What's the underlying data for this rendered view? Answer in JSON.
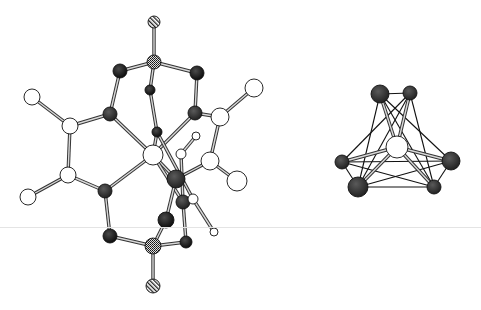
{
  "figure": {
    "caption": "",
    "background": "#ffffff",
    "scanline_color": "#e4e4e4"
  },
  "styles": {
    "black": {
      "fill": "#1a1a1a",
      "stroke": "#000000"
    },
    "darkgray": {
      "fill": "#3a3a3a",
      "stroke": "#000000"
    },
    "white": {
      "fill": "#ffffff",
      "stroke": "#222222"
    },
    "grid": {
      "fill": "url(#gridPat)",
      "stroke": "#000000"
    },
    "hatched": {
      "fill": "url(#hatchPat)",
      "stroke": "#000000"
    }
  },
  "molecules": [
    {
      "id": "left-complex",
      "label": "Molecule",
      "atoms": [
        {
          "id": "a1",
          "x": 154,
          "y": 22,
          "r": 6,
          "style": "hatched"
        },
        {
          "id": "a2",
          "x": 154,
          "y": 62,
          "r": 7,
          "style": "grid"
        },
        {
          "id": "a3",
          "x": 120,
          "y": 71,
          "r": 7,
          "style": "black"
        },
        {
          "id": "a4",
          "x": 197,
          "y": 73,
          "r": 7,
          "style": "black"
        },
        {
          "id": "a5",
          "x": 150,
          "y": 90,
          "r": 5,
          "style": "black"
        },
        {
          "id": "a6",
          "x": 110,
          "y": 114,
          "r": 7,
          "style": "darkgray"
        },
        {
          "id": "a7",
          "x": 195,
          "y": 113,
          "r": 7,
          "style": "darkgray"
        },
        {
          "id": "a8",
          "x": 32,
          "y": 97,
          "r": 8,
          "style": "white"
        },
        {
          "id": "a9",
          "x": 70,
          "y": 126,
          "r": 8,
          "style": "white"
        },
        {
          "id": "a10",
          "x": 68,
          "y": 175,
          "r": 8,
          "style": "white"
        },
        {
          "id": "a11",
          "x": 28,
          "y": 197,
          "r": 8,
          "style": "white"
        },
        {
          "id": "a12",
          "x": 105,
          "y": 191,
          "r": 7,
          "style": "darkgray"
        },
        {
          "id": "a13",
          "x": 153,
          "y": 155,
          "r": 10,
          "style": "white"
        },
        {
          "id": "a14",
          "x": 157,
          "y": 132,
          "r": 5,
          "style": "black"
        },
        {
          "id": "a15",
          "x": 196,
          "y": 136,
          "r": 4,
          "style": "white"
        },
        {
          "id": "a16",
          "x": 181,
          "y": 154,
          "r": 5,
          "style": "white"
        },
        {
          "id": "a17",
          "x": 220,
          "y": 117,
          "r": 9,
          "style": "white"
        },
        {
          "id": "a18",
          "x": 254,
          "y": 88,
          "r": 9,
          "style": "white"
        },
        {
          "id": "a19",
          "x": 210,
          "y": 161,
          "r": 9,
          "style": "white"
        },
        {
          "id": "a20",
          "x": 237,
          "y": 181,
          "r": 10,
          "style": "white"
        },
        {
          "id": "a21",
          "x": 176,
          "y": 179,
          "r": 9,
          "style": "darkgray"
        },
        {
          "id": "a22",
          "x": 183,
          "y": 202,
          "r": 7,
          "style": "darkgray"
        },
        {
          "id": "a23",
          "x": 193,
          "y": 199,
          "r": 5,
          "style": "white"
        },
        {
          "id": "a24",
          "x": 166,
          "y": 220,
          "r": 8,
          "style": "black"
        },
        {
          "id": "a25",
          "x": 110,
          "y": 236,
          "r": 7,
          "style": "black"
        },
        {
          "id": "a26",
          "x": 186,
          "y": 242,
          "r": 6,
          "style": "black"
        },
        {
          "id": "a27",
          "x": 153,
          "y": 246,
          "r": 8,
          "style": "grid"
        },
        {
          "id": "a28",
          "x": 153,
          "y": 286,
          "r": 7,
          "style": "hatched"
        },
        {
          "id": "a29",
          "x": 214,
          "y": 232,
          "r": 4,
          "style": "white"
        }
      ],
      "bonds": [
        [
          "a1",
          "a2"
        ],
        [
          "a2",
          "a3"
        ],
        [
          "a2",
          "a4"
        ],
        [
          "a2",
          "a5"
        ],
        [
          "a3",
          "a6"
        ],
        [
          "a4",
          "a7"
        ],
        [
          "a5",
          "a14"
        ],
        [
          "a6",
          "a9"
        ],
        [
          "a9",
          "a8"
        ],
        [
          "a9",
          "a10"
        ],
        [
          "a10",
          "a11"
        ],
        [
          "a10",
          "a12"
        ],
        [
          "a6",
          "a13"
        ],
        [
          "a12",
          "a13"
        ],
        [
          "a7",
          "a13"
        ],
        [
          "a14",
          "a13"
        ],
        [
          "a7",
          "a17"
        ],
        [
          "a17",
          "a18"
        ],
        [
          "a17",
          "a19"
        ],
        [
          "a19",
          "a20"
        ],
        [
          "a19",
          "a21"
        ],
        [
          "a14",
          "a23"
        ],
        [
          "a15",
          "a16"
        ],
        [
          "a16",
          "a22"
        ],
        [
          "a13",
          "a21"
        ],
        [
          "a13",
          "a22"
        ],
        [
          "a21",
          "a24"
        ],
        [
          "a22",
          "a26"
        ],
        [
          "a23",
          "a29"
        ],
        [
          "a12",
          "a25"
        ],
        [
          "a25",
          "a27"
        ],
        [
          "a26",
          "a27"
        ],
        [
          "a24",
          "a27"
        ],
        [
          "a27",
          "a28"
        ]
      ]
    },
    {
      "id": "right-cluster",
      "label": "Cluster",
      "atoms": [
        {
          "id": "b1",
          "x": 380,
          "y": 94,
          "r": 9,
          "style": "darkgray"
        },
        {
          "id": "b2",
          "x": 410,
          "y": 93,
          "r": 7,
          "style": "darkgray"
        },
        {
          "id": "b3",
          "x": 397,
          "y": 147,
          "r": 11,
          "style": "white"
        },
        {
          "id": "b4",
          "x": 342,
          "y": 162,
          "r": 7,
          "style": "darkgray"
        },
        {
          "id": "b5",
          "x": 451,
          "y": 161,
          "r": 9,
          "style": "darkgray"
        },
        {
          "id": "b6",
          "x": 358,
          "y": 187,
          "r": 10,
          "style": "darkgray"
        },
        {
          "id": "b7",
          "x": 434,
          "y": 187,
          "r": 7,
          "style": "darkgray"
        }
      ],
      "bonds": [
        [
          "b3",
          "b1"
        ],
        [
          "b3",
          "b2"
        ],
        [
          "b3",
          "b4"
        ],
        [
          "b3",
          "b5"
        ],
        [
          "b3",
          "b6"
        ],
        [
          "b3",
          "b7"
        ]
      ],
      "lines": [
        [
          "b1",
          "b2"
        ],
        [
          "b1",
          "b5"
        ],
        [
          "b1",
          "b6"
        ],
        [
          "b2",
          "b4"
        ],
        [
          "b2",
          "b7"
        ],
        [
          "b4",
          "b6"
        ],
        [
          "b4",
          "b5"
        ],
        [
          "b4",
          "b7"
        ],
        [
          "b6",
          "b5"
        ],
        [
          "b6",
          "b7"
        ],
        [
          "b5",
          "b7"
        ],
        [
          "b1",
          "b7"
        ],
        [
          "b2",
          "b6"
        ]
      ]
    }
  ]
}
